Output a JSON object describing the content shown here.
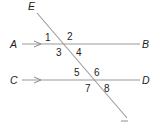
{
  "diagram": {
    "type": "parallel-lines-transversal",
    "colors": {
      "line": "#9a9a9a",
      "text": "#222222",
      "background": "#ffffff"
    },
    "points": {
      "A": "A",
      "B": "B",
      "C": "C",
      "D": "D",
      "E": "E"
    },
    "lines": [
      {
        "name": "AB",
        "from": "A",
        "to": "B",
        "parallel_marker": "arrow"
      },
      {
        "name": "CD",
        "from": "C",
        "to": "D",
        "parallel_marker": "arrow"
      },
      {
        "name": "transversal",
        "through": "E"
      }
    ],
    "angles": [
      "1",
      "2",
      "3",
      "4",
      "5",
      "6",
      "7",
      "8"
    ]
  }
}
